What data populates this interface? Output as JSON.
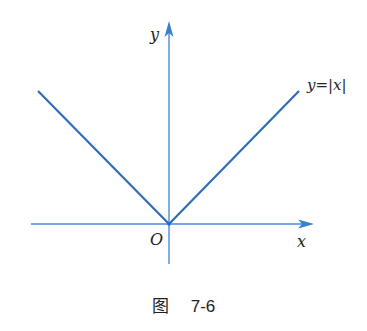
{
  "figure": {
    "caption_prefix": "图",
    "caption_number": "7-6",
    "function_label": "y=|x|",
    "axis_labels": {
      "x": "x",
      "y": "y",
      "origin": "O"
    },
    "colors": {
      "axis": "#3a7fd0",
      "graph": "#2f6db8",
      "text": "#222222"
    }
  }
}
